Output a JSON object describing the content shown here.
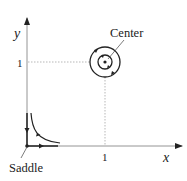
{
  "diagram": {
    "type": "phase-portrait",
    "axes": {
      "x_label": "x",
      "y_label": "y",
      "x_tick_label": "1",
      "y_tick_label": "1"
    },
    "fixed_points": [
      {
        "name": "Center",
        "label": "Center",
        "x": 1,
        "y": 1,
        "type": "center"
      },
      {
        "name": "Saddle",
        "label": "Saddle",
        "x": 0,
        "y": 0,
        "type": "saddle"
      }
    ],
    "colors": {
      "line": "#222222",
      "guide": "#999999",
      "background": "#ffffff"
    }
  }
}
